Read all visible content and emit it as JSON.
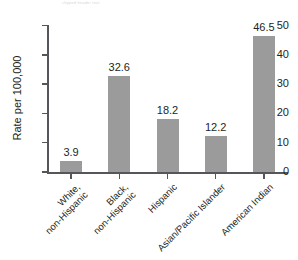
{
  "chart_data": {
    "type": "bar",
    "title": "",
    "subtitle": "",
    "xlabel": "",
    "ylabel": "Rate per 100,000",
    "ylim": [
      0,
      50
    ],
    "yticks": [
      0,
      10,
      20,
      30,
      40,
      50
    ],
    "ytick_labels": [
      "0",
      "10",
      "20",
      "30",
      "40",
      "50"
    ],
    "grid": false,
    "legend": null,
    "bar_color": "#9b9b9b",
    "axis_color": "#55565a",
    "text_color": "#231f20",
    "categories": [
      "White, non-Hispanic",
      "Black, non-Hispanic",
      "Hispanic",
      "Asian/Pacific Islander",
      "American Indian"
    ],
    "category_lines": [
      [
        "White,",
        "non-Hispanic"
      ],
      [
        "Black,",
        "non-Hispanic"
      ],
      [
        "Hispanic",
        ""
      ],
      [
        "Asian/Pacific Islander",
        ""
      ],
      [
        "American Indian",
        ""
      ]
    ],
    "values": [
      3.9,
      32.6,
      18.2,
      12.2,
      46.5
    ],
    "value_labels": [
      "3.9",
      "32.6",
      "18.2",
      "12.2",
      "46.5"
    ]
  },
  "artifact": {
    "top_clipped_text": "clipped header text"
  }
}
